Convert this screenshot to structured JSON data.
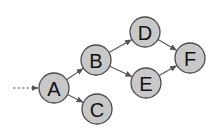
{
  "diagram": {
    "type": "directed-graph",
    "nodes": [
      {
        "id": "A",
        "label": "A",
        "x": 54,
        "y": 88
      },
      {
        "id": "B",
        "label": "B",
        "x": 96,
        "y": 60
      },
      {
        "id": "C",
        "label": "C",
        "x": 97,
        "y": 109
      },
      {
        "id": "D",
        "label": "D",
        "x": 145,
        "y": 32
      },
      {
        "id": "E",
        "label": "E",
        "x": 146,
        "y": 83
      },
      {
        "id": "F",
        "label": "F",
        "x": 190,
        "y": 58
      }
    ],
    "edges": [
      {
        "from": "A",
        "to": "B"
      },
      {
        "from": "A",
        "to": "C"
      },
      {
        "from": "B",
        "to": "D"
      },
      {
        "from": "B",
        "to": "E"
      },
      {
        "from": "D",
        "to": "F"
      },
      {
        "from": "E",
        "to": "F"
      }
    ],
    "entry_edge": {
      "to": "A",
      "style": "dashed"
    },
    "colors": {
      "node_fill": "#c8c8c8",
      "node_stroke": "#4a4a4a",
      "edge": "#555555"
    }
  }
}
